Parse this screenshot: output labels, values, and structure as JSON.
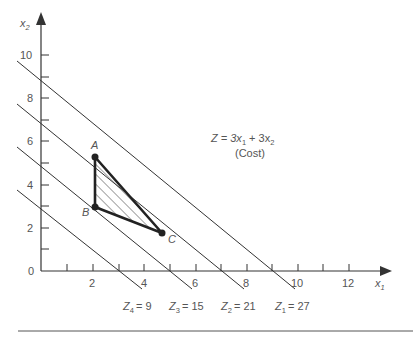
{
  "axes": {
    "x_label": "x",
    "x_label_sub": "1",
    "y_label": "x",
    "y_label_sub": "2",
    "origin_label": "0",
    "x_ticks": [
      "2",
      "4",
      "6",
      "8",
      "10",
      "12"
    ],
    "y_ticks": [
      "2",
      "4",
      "6",
      "8",
      "10"
    ]
  },
  "objective": {
    "equation_prefix": "Z = 3x",
    "sub1": "1",
    "mid": " + 3x",
    "sub2": "2",
    "note": "(Cost)"
  },
  "vertices": {
    "A": {
      "label": "A",
      "x1": 2,
      "x2": 5.3
    },
    "B": {
      "label": "B",
      "x1": 2,
      "x2": 3
    },
    "C": {
      "label": "C",
      "x1": 4.7,
      "x2": 1.8
    }
  },
  "iso_lines": [
    {
      "name": "Z",
      "sub": "4",
      "value": "= 9"
    },
    {
      "name": "Z",
      "sub": "3",
      "value": "= 15"
    },
    {
      "name": "Z",
      "sub": "2",
      "value": "= 21"
    },
    {
      "name": "Z",
      "sub": "1",
      "value": "= 27"
    }
  ],
  "colors": {
    "ink": "#333333",
    "text": "#555555"
  }
}
